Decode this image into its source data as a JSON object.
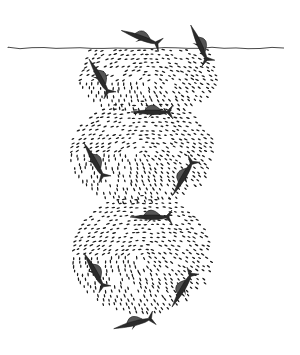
{
  "illustration": {
    "subject": "sailfish herding a bait ball of small fish",
    "background": "#ffffff",
    "ink": "#1a1a1a",
    "water_line": {
      "y": 48,
      "x_start": 8,
      "x_end": 286
    },
    "schools": [
      {
        "cx": 150,
        "cy": 80,
        "rx": 70,
        "ry": 34,
        "top_flat": true
      },
      {
        "cx": 143,
        "cy": 153,
        "rx": 72,
        "ry": 52
      },
      {
        "cx": 143,
        "cy": 255,
        "rx": 70,
        "ry": 60
      }
    ],
    "sailfish": [
      {
        "x": 142,
        "y": 38,
        "angle": 20,
        "scale": 1.0
      },
      {
        "x": 200,
        "y": 45,
        "angle": 65,
        "scale": 1.0
      },
      {
        "x": 100,
        "y": 78,
        "angle": 60,
        "scale": 1.0
      },
      {
        "x": 153,
        "y": 112,
        "angle": 0,
        "scale": 1.0
      },
      {
        "x": 95,
        "y": 162,
        "angle": 60,
        "scale": 1.0
      },
      {
        "x": 184,
        "y": 176,
        "angle": -60,
        "scale": 1.0
      },
      {
        "x": 152,
        "y": 217,
        "angle": 0,
        "scale": 1.0
      },
      {
        "x": 95,
        "y": 272,
        "angle": 60,
        "scale": 1.0
      },
      {
        "x": 183,
        "y": 288,
        "angle": -60,
        "scale": 1.0
      },
      {
        "x": 135,
        "y": 323,
        "angle": -15,
        "scale": 1.0
      }
    ]
  }
}
